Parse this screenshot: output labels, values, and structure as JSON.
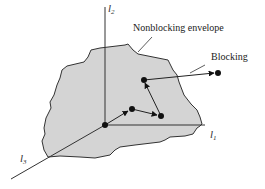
{
  "diagram": {
    "labels": {
      "nonblocking": "Nonblocking envelope",
      "blocking": "Blocking"
    },
    "axes": {
      "l1": {
        "name": "l",
        "sub": "1"
      },
      "l2": {
        "name": "l",
        "sub": "2"
      },
      "l3": {
        "name": "l",
        "sub": "3"
      }
    },
    "colors": {
      "envelope_fill": "#d4d4d4",
      "envelope_stroke": "#333333",
      "line": "#222222",
      "point": "#111111"
    },
    "points": [
      {
        "id": "origin",
        "x": 105,
        "y": 125
      },
      {
        "id": "p2",
        "x": 132,
        "y": 109
      },
      {
        "id": "p3",
        "x": 161,
        "y": 116
      },
      {
        "id": "p4",
        "x": 144,
        "y": 80
      },
      {
        "id": "p5-blocking",
        "x": 218,
        "y": 73
      }
    ]
  }
}
